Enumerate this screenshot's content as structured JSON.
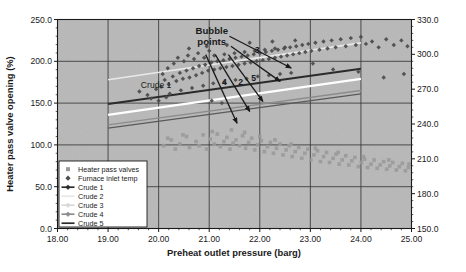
{
  "chart_data": {
    "type": "scatter",
    "title": "",
    "xlabel": "Preheat outlet pressure (barg)",
    "ylabel": "Heater pass valve opening (%)",
    "ylabel_right": "Furnace inlet temperature",
    "xlim": [
      18.0,
      25.0
    ],
    "ylim": [
      0.0,
      250.0
    ],
    "ylim_right": [
      150.0,
      330.0
    ],
    "xticks": [
      "18.00",
      "19.00",
      "20.00",
      "21.00",
      "22.00",
      "23.00",
      "24.00",
      "25.00"
    ],
    "xtick_values": [
      18.0,
      19.0,
      20.0,
      21.0,
      22.0,
      23.0,
      24.0,
      25.0
    ],
    "yticks": [
      "0.0",
      "50.0",
      "100.0",
      "150.0",
      "200.0",
      "250.0"
    ],
    "ytick_values": [
      0.0,
      50.0,
      100.0,
      150.0,
      200.0,
      250.0
    ],
    "yticks_right": [
      "150.0",
      "180.0",
      "210.0",
      "240.0",
      "270.0",
      "300.0",
      "330.0"
    ],
    "ytick_values_right": [
      150.0,
      180.0,
      210.0,
      240.0,
      270.0,
      300.0,
      330.0
    ],
    "grid": true,
    "legend_position": "lower-left",
    "plot_bg_color": "#b3b3b3",
    "series": [
      {
        "name": "Heater pass valves",
        "type": "scatter",
        "marker": "square",
        "color": "#9a9a9a",
        "axis": "left",
        "points": [
          [
            20.25,
            106
          ],
          [
            20.42,
            101
          ],
          [
            20.55,
            110
          ],
          [
            20.61,
            97
          ],
          [
            20.74,
            104
          ],
          [
            20.8,
            99
          ],
          [
            20.88,
            112
          ],
          [
            20.95,
            95
          ],
          [
            21.02,
            107
          ],
          [
            21.1,
            101
          ],
          [
            21.16,
            113
          ],
          [
            21.22,
            98
          ],
          [
            21.29,
            104
          ],
          [
            21.35,
            109
          ],
          [
            21.41,
            95
          ],
          [
            21.47,
            102
          ],
          [
            21.53,
            106
          ],
          [
            21.6,
            99
          ],
          [
            21.66,
            111
          ],
          [
            21.72,
            96
          ],
          [
            21.78,
            103
          ],
          [
            21.84,
            108
          ],
          [
            21.9,
            94
          ],
          [
            21.96,
            100
          ],
          [
            22.03,
            105
          ],
          [
            22.09,
            92
          ],
          [
            22.15,
            98
          ],
          [
            22.21,
            103
          ],
          [
            22.27,
            90
          ],
          [
            22.33,
            96
          ],
          [
            22.4,
            101
          ],
          [
            22.46,
            88
          ],
          [
            22.52,
            94
          ],
          [
            22.58,
            99
          ],
          [
            22.64,
            86
          ],
          [
            22.7,
            92
          ],
          [
            22.77,
            97
          ],
          [
            22.83,
            84
          ],
          [
            22.89,
            90
          ],
          [
            22.95,
            95
          ],
          [
            23.01,
            82
          ],
          [
            23.07,
            88
          ],
          [
            23.14,
            93
          ],
          [
            23.2,
            80
          ],
          [
            23.26,
            86
          ],
          [
            23.32,
            91
          ],
          [
            23.38,
            79
          ],
          [
            23.45,
            84
          ],
          [
            23.51,
            89
          ],
          [
            23.57,
            77
          ],
          [
            23.63,
            82
          ],
          [
            23.7,
            87
          ],
          [
            23.76,
            76
          ],
          [
            23.82,
            81
          ],
          [
            23.88,
            85
          ],
          [
            23.95,
            74
          ],
          [
            24.01,
            79
          ],
          [
            24.07,
            83
          ],
          [
            24.13,
            73
          ],
          [
            24.2,
            77
          ],
          [
            24.26,
            82
          ],
          [
            24.32,
            72
          ],
          [
            24.38,
            76
          ],
          [
            24.45,
            80
          ],
          [
            24.51,
            71
          ],
          [
            24.57,
            75
          ],
          [
            24.63,
            79
          ],
          [
            24.7,
            70
          ],
          [
            24.76,
            74
          ],
          [
            24.82,
            78
          ],
          [
            24.88,
            69
          ],
          [
            24.94,
            73
          ],
          [
            20.1,
            99
          ],
          [
            20.18,
            108
          ],
          [
            20.33,
            95
          ],
          [
            20.48,
            112
          ],
          [
            21.06,
            116
          ],
          [
            21.44,
            118
          ],
          [
            21.7,
            115
          ],
          [
            22.0,
            110
          ],
          [
            22.3,
            106
          ],
          [
            22.62,
            101
          ],
          [
            23.1,
            96
          ],
          [
            23.55,
            91
          ],
          [
            24.05,
            86
          ],
          [
            24.55,
            82
          ],
          [
            24.95,
            77
          ]
        ]
      },
      {
        "name": "Furnace inlet temp",
        "type": "scatter",
        "marker": "diamond",
        "color": "#4d4d4d",
        "axis": "right",
        "points": [
          [
            19.62,
            118
          ],
          [
            19.78,
            115
          ],
          [
            19.95,
            120
          ],
          [
            20.05,
            122
          ],
          [
            20.12,
            128
          ],
          [
            20.2,
            124
          ],
          [
            20.28,
            131
          ],
          [
            20.35,
            127
          ],
          [
            20.42,
            134
          ],
          [
            20.48,
            129
          ],
          [
            20.55,
            136
          ],
          [
            20.61,
            130
          ],
          [
            20.68,
            138
          ],
          [
            20.74,
            132
          ],
          [
            20.8,
            140
          ],
          [
            20.86,
            134
          ],
          [
            20.92,
            141
          ],
          [
            20.98,
            136
          ],
          [
            21.04,
            143
          ],
          [
            21.1,
            137
          ],
          [
            21.16,
            144
          ],
          [
            21.22,
            138
          ],
          [
            21.28,
            145
          ],
          [
            21.34,
            139
          ],
          [
            21.4,
            146
          ],
          [
            21.46,
            140
          ],
          [
            21.52,
            147
          ],
          [
            21.58,
            141
          ],
          [
            21.64,
            148
          ],
          [
            21.7,
            142
          ],
          [
            21.76,
            149
          ],
          [
            21.82,
            143
          ],
          [
            21.88,
            150
          ],
          [
            21.94,
            144
          ],
          [
            22.0,
            151
          ],
          [
            22.06,
            145
          ],
          [
            22.12,
            152
          ],
          [
            22.18,
            146
          ],
          [
            22.24,
            153
          ],
          [
            22.3,
            147
          ],
          [
            22.36,
            154
          ],
          [
            22.42,
            148
          ],
          [
            22.48,
            155
          ],
          [
            22.54,
            149
          ],
          [
            22.6,
            156
          ],
          [
            22.66,
            150
          ],
          [
            22.72,
            157
          ],
          [
            22.78,
            151
          ],
          [
            22.84,
            158
          ],
          [
            22.9,
            152
          ],
          [
            22.96,
            159
          ],
          [
            23.02,
            153
          ],
          [
            23.1,
            160
          ],
          [
            23.18,
            154
          ],
          [
            23.26,
            161
          ],
          [
            23.34,
            155
          ],
          [
            23.42,
            162
          ],
          [
            23.5,
            156
          ],
          [
            23.6,
            163
          ],
          [
            23.7,
            157
          ],
          [
            23.8,
            164
          ],
          [
            23.9,
            158
          ],
          [
            24.0,
            165
          ],
          [
            24.1,
            159
          ],
          [
            24.22,
            161
          ],
          [
            24.35,
            156
          ],
          [
            24.5,
            163
          ],
          [
            24.65,
            158
          ],
          [
            24.8,
            162
          ],
          [
            24.92,
            157
          ],
          [
            20.22,
            116
          ],
          [
            20.44,
            119
          ],
          [
            20.66,
            121
          ],
          [
            20.88,
            123
          ],
          [
            21.08,
            125
          ],
          [
            21.3,
            126
          ],
          [
            21.52,
            128
          ],
          [
            21.74,
            129
          ],
          [
            21.96,
            131
          ],
          [
            22.18,
            132
          ],
          [
            22.4,
            133
          ],
          [
            22.62,
            134
          ],
          [
            20.3,
            142
          ],
          [
            20.5,
            144
          ],
          [
            20.7,
            146
          ],
          [
            20.9,
            147
          ],
          [
            21.1,
            149
          ],
          [
            21.3,
            150
          ],
          [
            21.5,
            151
          ],
          [
            21.7,
            152
          ],
          [
            21.9,
            153
          ],
          [
            22.1,
            154
          ],
          [
            22.3,
            155
          ],
          [
            22.5,
            156
          ],
          [
            19.85,
            112
          ],
          [
            20.0,
            110
          ],
          [
            20.15,
            113
          ],
          [
            21.05,
            110
          ],
          [
            21.25,
            108
          ],
          [
            22.55,
            140
          ],
          [
            23.05,
            142
          ],
          [
            23.45,
            137
          ],
          [
            23.95,
            135
          ],
          [
            24.45,
            130
          ],
          [
            24.85,
            133
          ],
          [
            20.6,
            155
          ],
          [
            20.95,
            157
          ],
          [
            21.35,
            158
          ],
          [
            21.8,
            160
          ],
          [
            22.25,
            161
          ],
          [
            22.7,
            162
          ],
          [
            20.08,
            133
          ],
          [
            20.18,
            138
          ],
          [
            20.38,
            147
          ],
          [
            20.58,
            149
          ],
          [
            20.78,
            151
          ],
          [
            21.0,
            153
          ]
        ]
      }
    ],
    "lines": [
      {
        "name": "Crude 1",
        "color": "#2b2b2b",
        "width": 2.0,
        "x": [
          19.0,
          24.0
        ],
        "y": [
          149.0,
          191.0
        ]
      },
      {
        "name": "Crude 2",
        "color": "#e8e8e8",
        "width": 1.6,
        "x": [
          19.0,
          24.0
        ],
        "y": [
          178.0,
          222.0
        ]
      },
      {
        "name": "Crude 3",
        "color": "#ffffff",
        "width": 2.2,
        "x": [
          19.0,
          24.0
        ],
        "y": [
          136.0,
          179.0
        ]
      },
      {
        "name": "Crude 4",
        "color": "#8c8c8c",
        "width": 1.4,
        "x": [
          19.0,
          24.0
        ],
        "y": [
          124.0,
          165.0
        ]
      },
      {
        "name": "Crude 5",
        "color": "#5a5a5a",
        "width": 1.4,
        "x": [
          19.0,
          24.0
        ],
        "y": [
          120.0,
          161.0
        ]
      }
    ],
    "annotations": [
      {
        "text": "Bubble",
        "x": 21.05,
        "y": 233.0
      },
      {
        "text": "points",
        "x": 21.05,
        "y": 219.0
      },
      {
        "text": "Crude 1",
        "x": 19.95,
        "y": 168.0
      },
      {
        "text": "3",
        "x": 21.95,
        "y": 210.0
      },
      {
        "text": "4",
        "x": 21.3,
        "y": 172.0
      },
      {
        "text": "2",
        "x": 21.62,
        "y": 172.0
      },
      {
        "text": "5",
        "x": 21.88,
        "y": 177.0
      }
    ],
    "arrows": [
      {
        "label": "3",
        "x1": 21.4,
        "y1": 230.0,
        "x2": 22.62,
        "y2": 192.0
      },
      {
        "label": "5",
        "x1": 21.43,
        "y1": 218.0,
        "x2": 22.4,
        "y2": 176.0
      },
      {
        "label": "2",
        "x1": 21.38,
        "y1": 208.0,
        "x2": 22.06,
        "y2": 152.0
      },
      {
        "label": "4",
        "x1": 21.12,
        "y1": 208.0,
        "x2": 21.8,
        "y2": 140.0
      },
      {
        "label": "1",
        "x1": 20.93,
        "y1": 208.0,
        "x2": 21.55,
        "y2": 126.0
      }
    ],
    "legend": {
      "items": [
        {
          "label": "Heater pass valves",
          "marker": "square",
          "color": "#9a9a9a",
          "line": false
        },
        {
          "label": "Furnace inlet temp",
          "marker": "diamond",
          "color": "#4d4d4d",
          "line": false
        },
        {
          "label": "Crude 1",
          "marker": "line-marker",
          "color": "#2b2b2b",
          "line": true
        },
        {
          "label": "Crude 2",
          "marker": "none",
          "color": "#e8e8e8",
          "line": true
        },
        {
          "label": "Crude 3",
          "marker": "line-marker",
          "color": "#d8d8d8",
          "line": true
        },
        {
          "label": "Crude 4",
          "marker": "line-marker",
          "color": "#8c8c8c",
          "line": true
        },
        {
          "label": "Crude 5",
          "marker": "line",
          "color": "#2b2b2b",
          "line": true
        }
      ]
    }
  }
}
